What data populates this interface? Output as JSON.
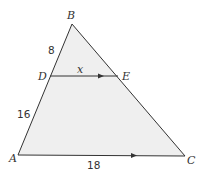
{
  "diagram": {
    "type": "triangle-with-parallel-segment",
    "fill_color": "#efefef",
    "stroke_color": "#333333",
    "vertices": {
      "A": {
        "label": "A",
        "x": 18,
        "y": 155
      },
      "B": {
        "label": "B",
        "x": 72,
        "y": 24
      },
      "C": {
        "label": "C",
        "x": 185,
        "y": 156
      },
      "D": {
        "label": "D",
        "x": 50,
        "y": 76
      },
      "E": {
        "label": "E",
        "x": 118,
        "y": 76
      }
    },
    "segment_labels": {
      "BD": "8",
      "DA": "16",
      "DE": "x",
      "AC": "18"
    },
    "parallel_marks": [
      "DE",
      "AC"
    ]
  }
}
